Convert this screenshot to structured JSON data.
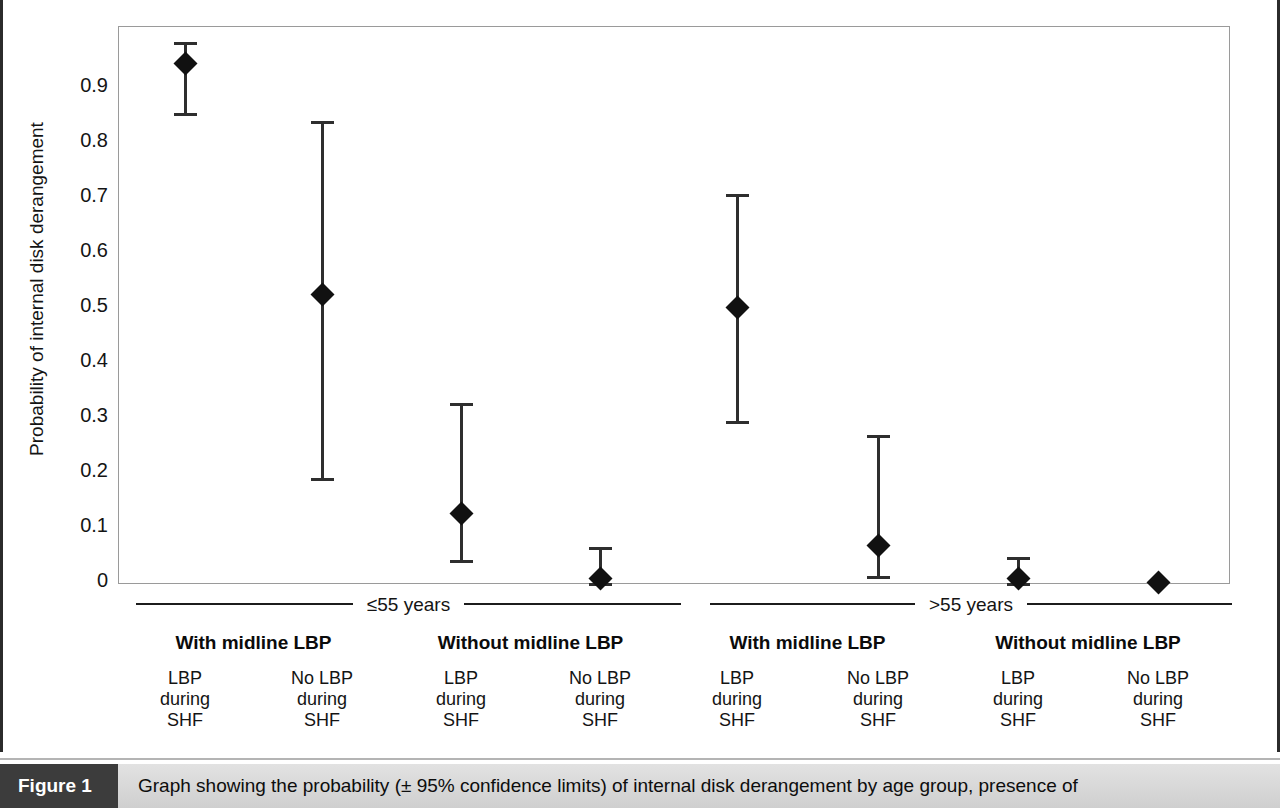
{
  "figure": {
    "caption_tag": "Figure 1",
    "caption_text": "Graph showing the probability (± 95% confidence limits) of internal disk derangement by age group, presence of"
  },
  "chart_data": {
    "type": "scatter",
    "title": "",
    "xlabel": "",
    "ylabel": "Probability of internal disk derangement",
    "ylim": [
      0,
      0.99
    ],
    "grid": false,
    "legend": "none",
    "error_bars": "95% confidence limits",
    "ytick_labels": [
      "0.9",
      "0.8",
      "0.7",
      "0.6",
      "0.5",
      "0.4",
      "0.3",
      "0.2",
      "0.1",
      "0"
    ],
    "ytick_values": [
      0.9,
      0.8,
      0.7,
      0.6,
      0.5,
      0.4,
      0.3,
      0.2,
      0.1,
      0
    ],
    "age_groups": [
      {
        "label": "≤55 years"
      },
      {
        "label": ">55 years"
      }
    ],
    "subgroups": [
      {
        "label": "With midline LBP"
      },
      {
        "label": "Without midline LBP"
      },
      {
        "label": "With midline LBP"
      },
      {
        "label": "Without midline LBP"
      }
    ],
    "categories": [
      "LBP\nduring\nSHF",
      "No LBP\nduring\nSHF",
      "LBP\nduring\nSHF",
      "No LBP\nduring\nSHF",
      "LBP\nduring\nSHF",
      "No LBP\nduring\nSHF",
      "LBP\nduring\nSHF",
      "No LBP\nduring\nSHF"
    ],
    "category_lines": [
      [
        "LBP",
        "during",
        "SHF"
      ],
      [
        "No LBP",
        "during",
        "SHF"
      ],
      [
        "LBP",
        "during",
        "SHF"
      ],
      [
        "No LBP",
        "during",
        "SHF"
      ],
      [
        "LBP",
        "during",
        "SHF"
      ],
      [
        "No LBP",
        "during",
        "SHF"
      ],
      [
        "LBP",
        "during",
        "SHF"
      ],
      [
        "No LBP",
        "during",
        "SHF"
      ]
    ],
    "points": [
      {
        "index": 1,
        "age_group": "≤55 years",
        "midline_lbp": "With midline LBP",
        "lbp_during_shf": "LBP during SHF",
        "value": 0.945,
        "ci_low": 0.854,
        "ci_high": 0.984
      },
      {
        "index": 2,
        "age_group": "≤55 years",
        "midline_lbp": "With midline LBP",
        "lbp_during_shf": "No LBP during SHF",
        "value": 0.525,
        "ci_low": 0.191,
        "ci_high": 0.84
      },
      {
        "index": 3,
        "age_group": "≤55 years",
        "midline_lbp": "Without midline LBP",
        "lbp_during_shf": "LBP during SHF",
        "value": 0.127,
        "ci_low": 0.042,
        "ci_high": 0.327
      },
      {
        "index": 4,
        "age_group": "≤55 years",
        "midline_lbp": "Without midline LBP",
        "lbp_during_shf": "No LBP during SHF",
        "value": 0.01,
        "ci_low": 0.0,
        "ci_high": 0.066
      },
      {
        "index": 5,
        "age_group": ">55 years",
        "midline_lbp": "With midline LBP",
        "lbp_during_shf": "LBP during SHF",
        "value": 0.502,
        "ci_low": 0.294,
        "ci_high": 0.708
      },
      {
        "index": 6,
        "age_group": ">55 years",
        "midline_lbp": "With midline LBP",
        "lbp_during_shf": "No LBP during SHF",
        "value": 0.069,
        "ci_low": 0.013,
        "ci_high": 0.27
      },
      {
        "index": 7,
        "age_group": ">55 years",
        "midline_lbp": "Without midline LBP",
        "lbp_during_shf": "LBP during SHF",
        "value": 0.01,
        "ci_low": 0.0,
        "ci_high": 0.047
      },
      {
        "index": 8,
        "age_group": ">55 years",
        "midline_lbp": "Without midline LBP",
        "lbp_during_shf": "No LBP during SHF",
        "value": 0.001,
        "ci_low": 0.0,
        "ci_high": 0.003
      }
    ],
    "colors": {
      "marker": "#111111",
      "error_bar": "#2e2e2e",
      "axis": "#9a9a9a",
      "text": "#141414"
    }
  }
}
